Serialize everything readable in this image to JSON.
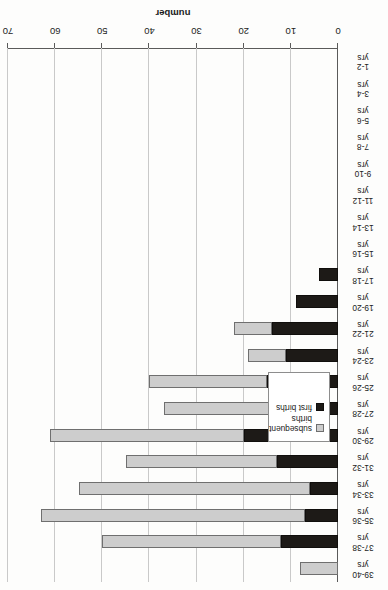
{
  "chart_data": {
    "type": "bar",
    "orientation": "horizontal-stacked",
    "title": "",
    "xlabel": "",
    "ylabel": "number",
    "ylim": [
      0,
      70
    ],
    "ytick_step": 10,
    "yticks": [
      "0",
      "10",
      "20",
      "30",
      "40",
      "50",
      "60",
      "70"
    ],
    "grid": true,
    "legend_position": "inside-left",
    "categories": [
      "1-2\nyrs",
      "3-4\nyrs",
      "5-6\nyrs",
      "7-8\nyrs",
      "9-10\nyrs",
      "11-12\nyrs",
      "13-14\nyrs",
      "15-16\nyrs",
      "17-18\nyrs",
      "19-20\nyrs",
      "21-22\nyrs",
      "23-24\nyrs",
      "25-26\nyrs",
      "27-28\nyrs",
      "29-30\nyrs",
      "31-32\nyrs",
      "33-34\nyrs",
      "35-36\nyrs",
      "37-38\nyrs",
      "39-40\nyrs"
    ],
    "category_ranges": [
      "1-2",
      "3-4",
      "5-6",
      "7-8",
      "9-10",
      "11-12",
      "13-14",
      "15-16",
      "17-18",
      "19-20",
      "21-22",
      "23-24",
      "25-26",
      "27-28",
      "29-30",
      "31-32",
      "33-34",
      "35-36",
      "37-38",
      "39-40"
    ],
    "category_unit": "yrs",
    "series": [
      {
        "name": "first births",
        "color": "#1d1a17",
        "values": [
          0,
          0,
          0,
          0,
          0,
          0,
          0,
          0,
          4,
          9,
          14,
          11,
          15,
          14,
          20,
          13,
          6,
          7,
          12,
          0
        ]
      },
      {
        "name": "subsequent births",
        "color": "#cdcdcd",
        "values": [
          0,
          0,
          0,
          0,
          0,
          0,
          0,
          0,
          0,
          0,
          8,
          8,
          25,
          23,
          41,
          32,
          49,
          56,
          38,
          8
        ]
      }
    ],
    "totals": [
      0,
      0,
      0,
      0,
      0,
      0,
      0,
      0,
      4,
      9,
      22,
      19,
      40,
      37,
      61,
      45,
      55,
      63,
      50,
      8
    ]
  },
  "legend": {
    "items": [
      {
        "label_line1": "subsequent",
        "label_line2": "births",
        "swatch": "light-gray-square"
      },
      {
        "label_line1": "first births",
        "label_line2": "",
        "swatch": "black-square"
      }
    ]
  },
  "axis": {
    "value_axis_title": "number"
  }
}
